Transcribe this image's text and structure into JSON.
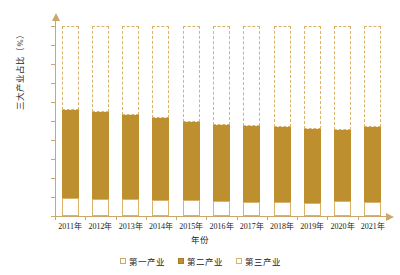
{
  "chart_data": {
    "type": "bar",
    "subtype": "stacked-bar-100-percent",
    "title": "",
    "xlabel": "年份",
    "ylabel": "三大产业占比（%）",
    "ylim": [
      0,
      100
    ],
    "ytick_labels": [
      "100.00",
      "90.00",
      "80.00",
      "70.00",
      "60.00",
      "50.00",
      "40.00",
      "30.00",
      "20.00",
      "10.00",
      "0.00"
    ],
    "ytick_values": [
      100,
      90,
      80,
      70,
      60,
      50,
      40,
      30,
      20,
      10,
      0
    ],
    "grid": false,
    "legend_position": "bottom",
    "categories": [
      "2011年",
      "2012年",
      "2013年",
      "2014年",
      "2015年",
      "2016年",
      "2017年",
      "2018年",
      "2019年",
      "2020年",
      "2021年"
    ],
    "series": [
      {
        "name": "第一产业",
        "color": "#ffffff",
        "edge_color": "#d9b36b",
        "values": [
          9.5,
          9.2,
          9.0,
          8.6,
          8.4,
          8.1,
          7.6,
          7.2,
          7.1,
          7.7,
          7.3
        ]
      },
      {
        "name": "第二产业",
        "color": "#bd8f2f",
        "values": [
          46.3,
          45.6,
          44.3,
          43.2,
          41.0,
          39.6,
          39.9,
          39.7,
          38.6,
          37.8,
          39.4
        ]
      },
      {
        "name": "第三产业",
        "color": "#ffffff",
        "edge_color": "#d9b36b",
        "edge_style": "dashed",
        "values": [
          44.2,
          45.2,
          46.7,
          48.2,
          50.6,
          52.3,
          52.5,
          53.1,
          54.3,
          54.5,
          53.3
        ]
      }
    ],
    "stack_tops_first": [
      9.5,
      9.2,
      9.0,
      8.6,
      8.4,
      8.1,
      7.6,
      7.2,
      7.1,
      7.7,
      7.3
    ],
    "stack_tops_second": [
      55.8,
      54.8,
      53.3,
      51.8,
      49.4,
      47.7,
      47.5,
      46.9,
      45.7,
      45.5,
      46.7
    ]
  },
  "axes": {
    "y_title": "三大产业占比（%）",
    "x_title": "年份"
  },
  "legend": {
    "items": [
      {
        "label": "第一产业",
        "swatch": "hollow-square-icon"
      },
      {
        "label": "第二产业",
        "swatch": "filled-square-icon"
      },
      {
        "label": "第三产业",
        "swatch": "dashed-square-icon"
      }
    ]
  },
  "colors": {
    "bar_second": "#bd8f2f",
    "outline": "#d9b36b",
    "axis": "#c8a96a",
    "text": "#1b1b1b",
    "background": "#ffffff"
  }
}
